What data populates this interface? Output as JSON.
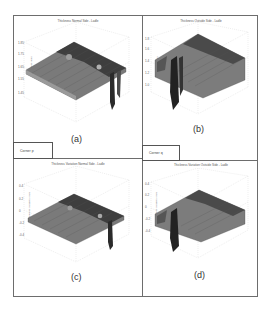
{
  "figure": {
    "panels": [
      {
        "id": "a",
        "label": "(a)",
        "title": "Thickness Normal Side - Ladle",
        "zlabel": "Thickness (mm)",
        "zticks": [
          "1.85",
          "1.75",
          "1.65",
          "1.55",
          "1.45"
        ],
        "xticks": [
          "0",
          "5",
          "10",
          "15",
          "20"
        ],
        "yticks": [
          "0",
          "5",
          "10",
          "15",
          "20"
        ]
      },
      {
        "id": "b",
        "label": "(b)",
        "title": "Thickness Outside Side - Ladle",
        "zlabel": "Thickness (mm)",
        "zticks": [
          "1.8",
          "1.6",
          "1.4",
          "1.2",
          "1.0"
        ],
        "xticks": [
          "0",
          "5",
          "10",
          "15",
          "20"
        ],
        "yticks": [
          "0",
          "5",
          "10",
          "15",
          "20"
        ]
      },
      {
        "id": "c",
        "label": "(c)",
        "title": "Thickness Variation Normal Side - Ladle",
        "zlabel": "Thickness Variation (mm)",
        "zticks": [
          "0.4",
          "0.2",
          "0",
          "-0.2",
          "-0.4"
        ],
        "xticks": [
          "0",
          "5",
          "10",
          "15",
          "20"
        ],
        "yticks": [
          "0",
          "5",
          "10",
          "15",
          "20"
        ]
      },
      {
        "id": "d",
        "label": "(d)",
        "title": "Thickness Variation Outside Side - Ladle",
        "zlabel": "Thickness Variation (mm)",
        "zticks": [
          "0.4",
          "0.2",
          "0",
          "-0.2",
          "-0.4"
        ],
        "xticks": [
          "0",
          "5",
          "10",
          "15",
          "20"
        ],
        "yticks": [
          "0",
          "5",
          "10",
          "15",
          "20"
        ]
      }
    ],
    "corners": {
      "p": "Corner p",
      "q": "Corner q"
    }
  },
  "colors": {
    "border": "#6d6d6d",
    "surface_dark": "#3a3a3a",
    "surface_mid": "#7a7a7a",
    "surface_light": "#b5b5b5",
    "grid": "#cfcfcf"
  }
}
